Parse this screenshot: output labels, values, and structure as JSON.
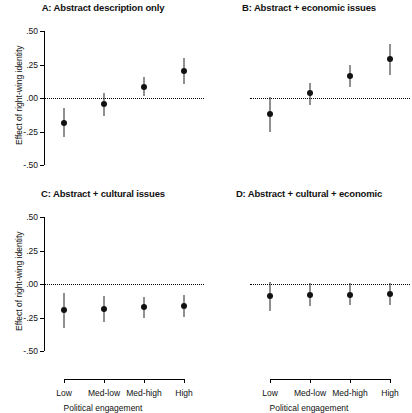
{
  "chart_data": {
    "type": "scatter",
    "title": "",
    "xlabel": "Political engagement",
    "ylabel": "Effect of right-wing identity",
    "categories": [
      "Low",
      "Med-low",
      "Med-high",
      "High"
    ],
    "ylim": [
      -0.5,
      0.5
    ],
    "yticks": [
      0.5,
      0.25,
      0.0,
      -0.25,
      -0.5
    ],
    "ytick_labels": [
      ".50",
      ".25",
      ".00",
      "-.25",
      "-.50"
    ],
    "grid": false,
    "legend": "none",
    "reference_line": 0.0,
    "reference_line_style": "dotted",
    "marker": "filled-circle",
    "error_bars": "95% confidence interval",
    "panels": [
      {
        "id": "A",
        "title": "A: Abstract description only",
        "show_yaxis": true,
        "show_xaxis": false,
        "values": [
          -0.185,
          -0.045,
          0.085,
          0.205
        ],
        "ci_low": [
          -0.29,
          -0.135,
          0.015,
          0.105
        ],
        "ci_high": [
          -0.075,
          0.04,
          0.16,
          0.3
        ]
      },
      {
        "id": "B",
        "title": "B: Abstract + economic issues",
        "show_yaxis": false,
        "show_xaxis": false,
        "values": [
          -0.12,
          0.035,
          0.165,
          0.29
        ],
        "ci_low": [
          -0.255,
          -0.05,
          0.08,
          0.175
        ],
        "ci_high": [
          0.01,
          0.115,
          0.245,
          0.4
        ]
      },
      {
        "id": "C",
        "title": "C: Abstract + cultural issues",
        "show_yaxis": true,
        "show_xaxis": true,
        "values": [
          -0.195,
          -0.185,
          -0.175,
          -0.165
        ],
        "ci_low": [
          -0.325,
          -0.28,
          -0.255,
          -0.245
        ],
        "ci_high": [
          -0.07,
          -0.09,
          -0.095,
          -0.085
        ]
      },
      {
        "id": "D",
        "title": "D: Abstract + cultural + economic",
        "show_yaxis": false,
        "show_xaxis": true,
        "values": [
          -0.09,
          -0.085,
          -0.085,
          -0.075
        ],
        "ci_low": [
          -0.205,
          -0.165,
          -0.155,
          -0.155
        ],
        "ci_high": [
          0.015,
          0.005,
          0.005,
          0.01
        ]
      }
    ]
  },
  "colors": {
    "marker": "#111111",
    "axis": "#000000",
    "background": "#ffffff"
  }
}
